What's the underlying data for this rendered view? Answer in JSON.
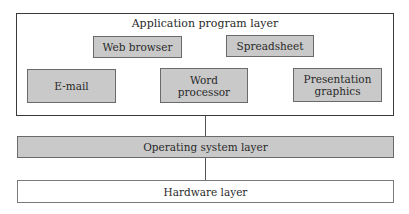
{
  "diagram": {
    "application_layer": {
      "title": "Application program layer",
      "apps": {
        "web_browser": "Web browser",
        "spreadsheet": "Spreadsheet",
        "email": "E-mail",
        "word_processor": "Word\nprocessor",
        "presentation": "Presentation\ngraphics"
      }
    },
    "os_layer": {
      "label": "Operating system layer"
    },
    "hardware_layer": {
      "label": "Hardware layer"
    },
    "colors": {
      "fill_gray": "#c9c9c9",
      "border": "#3a3a3a",
      "line": "#555555"
    }
  }
}
